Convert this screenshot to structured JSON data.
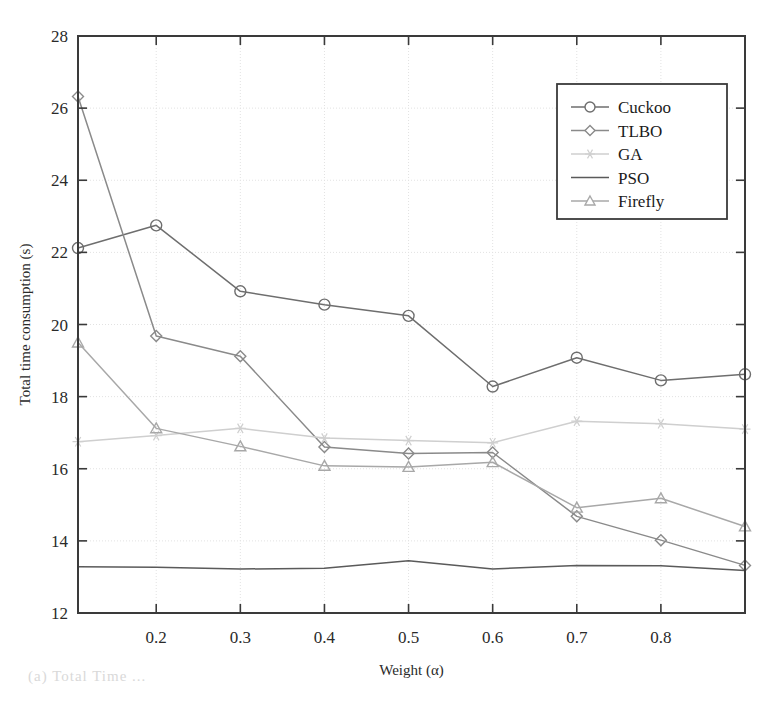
{
  "figure": {
    "background": "#ffffff",
    "frame_color": "#3a3a3a",
    "grid_color": "#e2e2e2",
    "caption_partial": "(a) Total Time ..."
  },
  "chart_data": {
    "type": "line",
    "title": "",
    "xlabel": "Weight (α)",
    "ylabel": "Total time consumption (s)",
    "xlim": [
      0.107,
      0.9
    ],
    "ylim": [
      12,
      28
    ],
    "xticks": [
      0.2,
      0.3,
      0.4,
      0.5,
      0.6,
      0.7,
      0.8
    ],
    "xtick_labels": [
      "0.2",
      "0.3",
      "0.4",
      "0.5",
      "0.6",
      "0.7",
      "0.8"
    ],
    "yticks": [
      12,
      14,
      16,
      18,
      20,
      22,
      24,
      26,
      28
    ],
    "ytick_labels": [
      "12",
      "14",
      "16",
      "18",
      "20",
      "22",
      "24",
      "26",
      "28"
    ],
    "grid": true,
    "legend_position": "top-right",
    "x": [
      0.107,
      0.2,
      0.3,
      0.4,
      0.5,
      0.6,
      0.7,
      0.8,
      0.9
    ],
    "series": [
      {
        "name": "Cuckoo",
        "marker": "circle",
        "color": "#6e6e6e",
        "values": [
          22.12,
          22.75,
          20.92,
          20.55,
          20.24,
          18.28,
          19.08,
          18.45,
          18.62
        ]
      },
      {
        "name": "TLBO",
        "marker": "diamond",
        "color": "#8a8a8a",
        "values": [
          26.32,
          19.68,
          19.12,
          16.6,
          16.42,
          16.45,
          14.68,
          14.02,
          13.32
        ]
      },
      {
        "name": "GA",
        "marker": "star",
        "color": "#cfcfcf",
        "values": [
          16.75,
          16.92,
          17.12,
          16.85,
          16.78,
          16.72,
          17.32,
          17.25,
          17.1
        ]
      },
      {
        "name": "PSO",
        "marker": "none",
        "color": "#5a5a5a",
        "values": [
          13.28,
          13.27,
          13.22,
          13.24,
          13.45,
          13.22,
          13.32,
          13.31,
          13.18
        ]
      },
      {
        "name": "Firefly",
        "marker": "triangle",
        "color": "#a8a8a8",
        "values": [
          19.5,
          17.12,
          16.62,
          16.08,
          16.05,
          16.18,
          14.92,
          15.18,
          14.4
        ]
      }
    ]
  }
}
